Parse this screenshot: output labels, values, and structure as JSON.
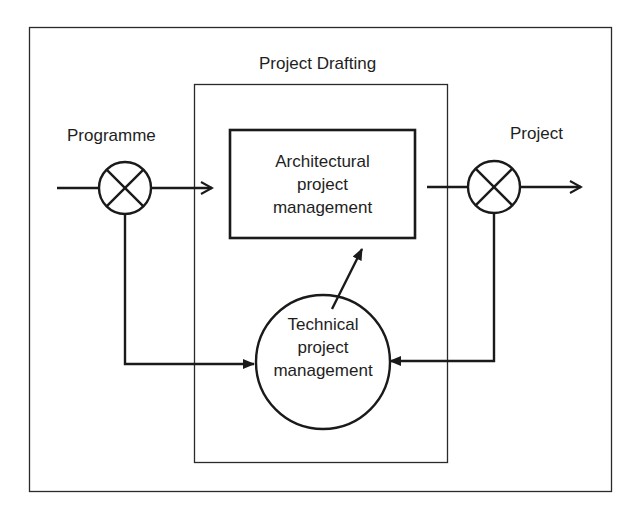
{
  "diagram": {
    "type": "block-diagram",
    "colors": {
      "stroke": "#1a1a1a",
      "background": "#ffffff"
    },
    "container_label": "Project Drafting",
    "input_label": "Programme",
    "output_label": "Project",
    "nodes": {
      "architectural": {
        "shape": "rectangle",
        "lines": [
          "Architectural",
          "project",
          "management"
        ]
      },
      "technical": {
        "shape": "circle",
        "lines": [
          "Technical",
          "project",
          "management"
        ]
      },
      "input_junction": {
        "shape": "summing-junction"
      },
      "output_junction": {
        "shape": "summing-junction"
      }
    },
    "edges": [
      {
        "from": "input",
        "to": "input_junction"
      },
      {
        "from": "input_junction",
        "to": "architectural"
      },
      {
        "from": "architectural",
        "to": "output_junction"
      },
      {
        "from": "output_junction",
        "to": "output"
      },
      {
        "from": "input_junction",
        "to": "technical"
      },
      {
        "from": "output_junction",
        "to": "technical"
      },
      {
        "from": "technical",
        "to": "architectural"
      }
    ]
  }
}
